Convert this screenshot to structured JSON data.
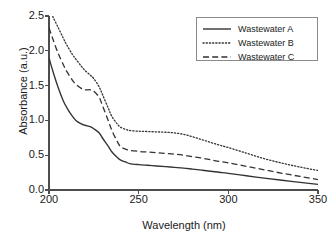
{
  "chart_data": {
    "type": "line",
    "title": "",
    "xlabel": "Wavelength (nm)",
    "ylabel": "Absorbance (a.u.)",
    "xlim": [
      200,
      350
    ],
    "ylim": [
      0.0,
      2.5
    ],
    "xticks": [
      200,
      250,
      300,
      350
    ],
    "yticks": [
      "0.0",
      "0.5",
      "1.0",
      "1.5",
      "2.0",
      "2.5"
    ],
    "grid": false,
    "legend_position": "top-right",
    "x": [
      200,
      202,
      205,
      208,
      210,
      213,
      215,
      218,
      220,
      223,
      225,
      228,
      230,
      233,
      235,
      238,
      240,
      243,
      245,
      250,
      255,
      260,
      265,
      270,
      275,
      280,
      285,
      290,
      295,
      300,
      310,
      320,
      330,
      340,
      350
    ],
    "series": [
      {
        "name": "Wastewater A",
        "style": "solid",
        "color": "#333333",
        "values": [
          1.9,
          1.72,
          1.48,
          1.28,
          1.18,
          1.06,
          1.0,
          0.95,
          0.93,
          0.91,
          0.88,
          0.82,
          0.74,
          0.63,
          0.55,
          0.47,
          0.43,
          0.4,
          0.38,
          0.365,
          0.355,
          0.345,
          0.335,
          0.325,
          0.315,
          0.3,
          0.285,
          0.27,
          0.255,
          0.24,
          0.205,
          0.17,
          0.14,
          0.11,
          0.08
        ]
      },
      {
        "name": "Wastewater B",
        "style": "dotted",
        "color": "#333333",
        "values": [
          2.62,
          2.5,
          2.34,
          2.18,
          2.08,
          1.95,
          1.88,
          1.78,
          1.72,
          1.65,
          1.6,
          1.48,
          1.36,
          1.18,
          1.06,
          0.95,
          0.9,
          0.87,
          0.855,
          0.845,
          0.84,
          0.835,
          0.83,
          0.82,
          0.8,
          0.765,
          0.725,
          0.685,
          0.645,
          0.61,
          0.53,
          0.45,
          0.385,
          0.33,
          0.28
        ]
      },
      {
        "name": "Wastewater C",
        "style": "dashed",
        "color": "#333333",
        "values": [
          2.33,
          2.18,
          1.97,
          1.8,
          1.7,
          1.58,
          1.52,
          1.46,
          1.44,
          1.44,
          1.42,
          1.33,
          1.2,
          1.0,
          0.86,
          0.7,
          0.62,
          0.585,
          0.57,
          0.555,
          0.545,
          0.535,
          0.525,
          0.515,
          0.5,
          0.48,
          0.46,
          0.435,
          0.41,
          0.39,
          0.34,
          0.29,
          0.24,
          0.195,
          0.15
        ]
      }
    ]
  },
  "legend": {
    "items": [
      {
        "label": "Wastewater A",
        "style": "solid"
      },
      {
        "label": "Wastewater B",
        "style": "dotted"
      },
      {
        "label": "Wastewater C",
        "style": "dashed"
      }
    ]
  }
}
